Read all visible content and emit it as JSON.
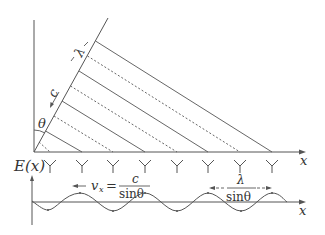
{
  "diagram": {
    "type": "phased-array wave diagram",
    "labels": {
      "lambda": "λ",
      "c": "c",
      "theta": "θ",
      "x_axis_top": "x",
      "x_axis_bottom": "x",
      "E_axis": "E(x)",
      "vx_lhs": "v",
      "vx_sub": "x",
      "vx_eq": "=",
      "vx_num": "c",
      "vx_den": "sinθ",
      "period_num": "λ",
      "period_den": "sinθ"
    },
    "antennas": {
      "count": 8,
      "x_positions": [
        50,
        82,
        113,
        145,
        177,
        208,
        240,
        272
      ]
    },
    "wavefronts": {
      "count": 8,
      "style_pattern": [
        "solid",
        "dashed"
      ]
    },
    "colors": {
      "line": "#555555",
      "text": "#333333",
      "background": "#ffffff"
    }
  }
}
